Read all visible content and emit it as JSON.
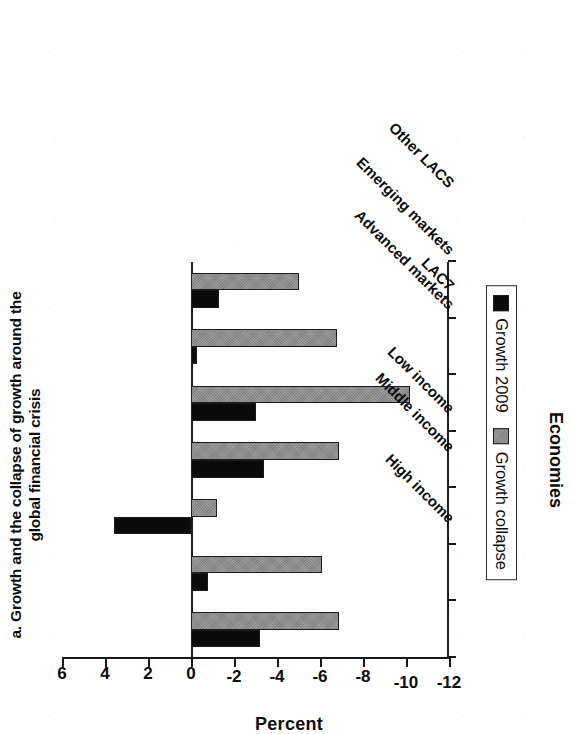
{
  "figure": {
    "title": "a. Growth and the collapse of growth around the global financial crisis",
    "title_line1": "a. Growth and the collapse of growth around the",
    "title_line2": "global financial crisis",
    "orientation": "rotated-90-ccw"
  },
  "legend": {
    "items": [
      {
        "label": "Growth 2009",
        "color": "#0b0b0b",
        "swatch": "legend-swatch-dark"
      },
      {
        "label": "Growth collapse",
        "color": "#8e8e8e",
        "swatch": "legend-swatch-gray"
      }
    ]
  },
  "axes": {
    "value_axis_title": "Percent",
    "category_axis_title": "Economies",
    "value_ticks": [
      "6",
      "4",
      "2",
      "0",
      "-2",
      "-4",
      "-6",
      "-8",
      "-10",
      "-12"
    ]
  },
  "chart_data": {
    "type": "bar",
    "title": "a. Growth and the collapse of growth around the global financial crisis",
    "orientation": "vertical-bars-rendered-rotated",
    "xlabel": "Economies",
    "ylabel": "Percent",
    "ylim": [
      -12,
      6
    ],
    "yticks": [
      6,
      4,
      2,
      0,
      -2,
      -4,
      -6,
      -8,
      -10,
      -12
    ],
    "grid": false,
    "legend_position": "below-axis",
    "zero_reference_line": 0,
    "categories": [
      "High income",
      "Middle income",
      "Low income",
      "Advanced markets",
      "Emerging markets",
      "LAC7",
      "Other LACS"
    ],
    "series": [
      {
        "name": "Growth 2009",
        "color": "#0b0b0b",
        "values": [
          -3.2,
          -0.8,
          3.6,
          -3.4,
          -3.0,
          -0.3,
          -1.3
        ]
      },
      {
        "name": "Growth collapse",
        "color": "#8e8e8e",
        "values": [
          -6.9,
          -6.1,
          -1.2,
          -6.9,
          -10.2,
          -6.8,
          -5.0
        ]
      }
    ]
  }
}
